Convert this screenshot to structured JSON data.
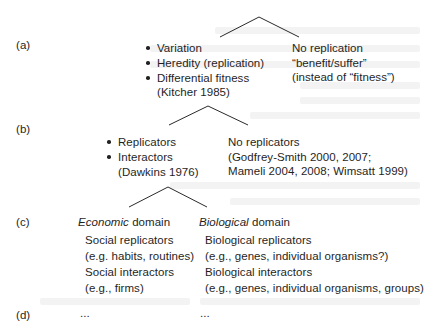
{
  "figure": {
    "panels": [
      {
        "label": "(a)",
        "left_branch": {
          "bullets": [
            "Variation",
            "Heredity (replication)",
            "Differential fitness"
          ],
          "citation": "(Kitcher 1985)"
        },
        "right_branch": {
          "lines": [
            "No replication",
            "“benefit/suffer”",
            "(instead of “fitness”)"
          ]
        }
      },
      {
        "label": "(b)",
        "left_branch": {
          "bullets": [
            "Replicators",
            "Interactors"
          ],
          "citation": "(Dawkins 1976)"
        },
        "right_branch": {
          "lines": [
            "No replicators",
            "(Godfrey-Smith 2000, 2007;",
            "Mameli 2004, 2008; Wimsatt 1999)"
          ]
        }
      },
      {
        "label": "(c)",
        "left_branch": {
          "heading_italic": "Economic",
          "heading_rest": " domain",
          "lines": [
            "Social replicators",
            "(e.g. habits, routines)",
            "Social interactors",
            "(e.g., firms)"
          ]
        },
        "right_branch": {
          "heading_italic": "Biological",
          "heading_rest": " domain",
          "lines": [
            "Biological replicators",
            "(e.g., genes, individual organisms?)",
            "Biological interactors",
            "(e.g., genes, individual organisms, groups)"
          ]
        }
      },
      {
        "label": "(d)",
        "left_branch": {
          "text": "..."
        },
        "right_branch": {
          "text": "..."
        }
      }
    ]
  }
}
